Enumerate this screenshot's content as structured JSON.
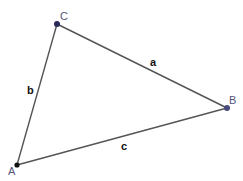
{
  "diagram": {
    "type": "triangle",
    "vertices": {
      "A": {
        "label": "A",
        "x": 17,
        "y": 165,
        "color": "#111111"
      },
      "B": {
        "label": "B",
        "x": 227,
        "y": 108,
        "color": "#4a4a7a"
      },
      "C": {
        "label": "C",
        "x": 57,
        "y": 24,
        "color": "#2a2a5a"
      }
    },
    "sides": {
      "a": {
        "label": "a",
        "from": "C",
        "to": "B"
      },
      "b": {
        "label": "b",
        "from": "A",
        "to": "C"
      },
      "c": {
        "label": "c",
        "from": "A",
        "to": "B"
      }
    },
    "line_color": "#444444"
  }
}
